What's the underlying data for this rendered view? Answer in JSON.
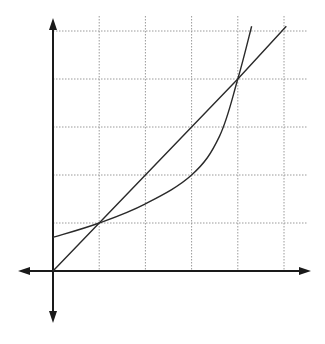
{
  "chart_data": {
    "type": "line",
    "title": "",
    "xlabel": "",
    "ylabel": "",
    "xlim": [
      0,
      5.5
    ],
    "ylim": [
      0,
      5.2
    ],
    "grid": true,
    "grid_style": "dotted",
    "x_ticks": [
      1,
      2,
      3,
      4,
      5
    ],
    "y_ticks": [
      1,
      2,
      3,
      4,
      5
    ],
    "tick_labels_shown": false,
    "legend": null,
    "series": [
      {
        "name": "linear line",
        "kind": "straight",
        "points": [
          [
            0,
            0
          ],
          [
            1,
            1
          ],
          [
            2,
            2
          ],
          [
            3,
            3
          ],
          [
            4,
            4
          ],
          [
            5.05,
            5.1
          ]
        ]
      },
      {
        "name": "curve",
        "kind": "smooth",
        "points": [
          [
            0,
            0.7
          ],
          [
            1,
            1
          ],
          [
            2,
            1.4
          ],
          [
            3,
            2
          ],
          [
            3.6,
            2.8
          ],
          [
            4,
            4
          ],
          [
            4.3,
            5.1
          ]
        ]
      }
    ],
    "colors": {
      "axis": "#1a1a1a",
      "grid": "#9a9a9a",
      "line": "#2a2a2a"
    }
  }
}
